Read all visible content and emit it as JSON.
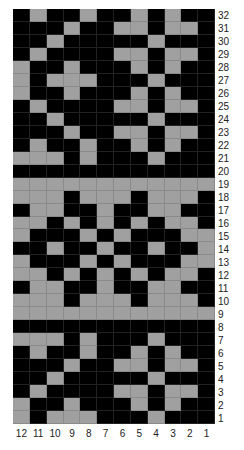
{
  "chart_data": {
    "type": "heatmap",
    "title": "",
    "colors": {
      "on": "#a0a0a0",
      "off": "#000000"
    },
    "column_labels": [
      "12",
      "11",
      "10",
      "9",
      "8",
      "7",
      "6",
      "5",
      "4",
      "3",
      "2",
      "1"
    ],
    "row_labels": [
      "32",
      "31",
      "30",
      "29",
      "28",
      "27",
      "26",
      "25",
      "24",
      "23",
      "22",
      "21",
      "20",
      "19",
      "18",
      "17",
      "16",
      "15",
      "14",
      "13",
      "12",
      "11",
      "10",
      "9",
      "8",
      "7",
      "6",
      "5",
      "4",
      "3",
      "2",
      "1"
    ],
    "grid": [
      [
        0,
        1,
        0,
        0,
        1,
        0,
        0,
        1,
        0,
        1,
        0,
        0
      ],
      [
        0,
        0,
        0,
        1,
        0,
        0,
        1,
        1,
        0,
        1,
        1,
        0
      ],
      [
        0,
        0,
        1,
        0,
        0,
        0,
        0,
        0,
        1,
        0,
        0,
        0
      ],
      [
        0,
        1,
        0,
        0,
        0,
        0,
        1,
        1,
        0,
        1,
        1,
        0
      ],
      [
        1,
        0,
        0,
        1,
        0,
        0,
        0,
        1,
        0,
        1,
        0,
        0
      ],
      [
        1,
        0,
        1,
        1,
        1,
        0,
        0,
        0,
        1,
        0,
        0,
        0
      ],
      [
        1,
        0,
        0,
        1,
        0,
        0,
        0,
        1,
        0,
        1,
        0,
        0
      ],
      [
        0,
        1,
        0,
        0,
        0,
        0,
        1,
        1,
        0,
        1,
        1,
        0
      ],
      [
        0,
        0,
        1,
        0,
        0,
        0,
        0,
        0,
        1,
        0,
        0,
        0
      ],
      [
        0,
        0,
        0,
        1,
        0,
        0,
        1,
        1,
        0,
        1,
        1,
        0
      ],
      [
        0,
        1,
        0,
        0,
        1,
        0,
        0,
        1,
        0,
        1,
        0,
        0
      ],
      [
        1,
        1,
        1,
        0,
        1,
        0,
        0,
        0,
        1,
        0,
        0,
        0
      ],
      [
        0,
        0,
        0,
        0,
        0,
        0,
        0,
        0,
        0,
        0,
        0,
        0
      ],
      [
        1,
        1,
        1,
        1,
        1,
        1,
        1,
        1,
        1,
        1,
        1,
        1
      ],
      [
        1,
        1,
        1,
        0,
        1,
        1,
        1,
        0,
        1,
        1,
        1,
        0
      ],
      [
        0,
        1,
        1,
        0,
        0,
        1,
        0,
        0,
        1,
        1,
        0,
        0
      ],
      [
        1,
        1,
        0,
        1,
        0,
        1,
        0,
        1,
        0,
        1,
        1,
        0
      ],
      [
        1,
        0,
        0,
        0,
        1,
        0,
        1,
        0,
        0,
        0,
        1,
        1
      ],
      [
        0,
        0,
        1,
        0,
        0,
        1,
        0,
        0,
        1,
        0,
        0,
        1
      ],
      [
        1,
        0,
        0,
        0,
        1,
        0,
        1,
        0,
        0,
        0,
        1,
        1
      ],
      [
        1,
        1,
        0,
        1,
        0,
        1,
        0,
        1,
        0,
        1,
        1,
        0
      ],
      [
        0,
        1,
        1,
        0,
        0,
        1,
        0,
        0,
        1,
        1,
        0,
        0
      ],
      [
        1,
        1,
        1,
        0,
        1,
        1,
        1,
        0,
        1,
        1,
        1,
        0
      ],
      [
        1,
        1,
        1,
        1,
        1,
        1,
        1,
        1,
        1,
        1,
        1,
        1
      ],
      [
        0,
        0,
        0,
        0,
        0,
        0,
        0,
        0,
        0,
        0,
        0,
        0
      ],
      [
        1,
        1,
        1,
        0,
        1,
        0,
        0,
        0,
        1,
        0,
        0,
        0
      ],
      [
        0,
        1,
        0,
        0,
        1,
        0,
        0,
        1,
        0,
        1,
        0,
        0
      ],
      [
        0,
        0,
        0,
        1,
        0,
        0,
        1,
        1,
        0,
        1,
        1,
        0
      ],
      [
        0,
        0,
        1,
        0,
        0,
        0,
        0,
        0,
        1,
        0,
        0,
        0
      ],
      [
        0,
        1,
        0,
        0,
        0,
        0,
        1,
        1,
        0,
        1,
        1,
        0
      ],
      [
        1,
        0,
        0,
        1,
        0,
        0,
        0,
        1,
        0,
        1,
        0,
        0
      ],
      [
        1,
        0,
        1,
        1,
        1,
        0,
        0,
        0,
        1,
        0,
        0,
        0
      ]
    ],
    "xlabel": "",
    "ylabel": "",
    "grid_lines": true,
    "legend": null
  }
}
